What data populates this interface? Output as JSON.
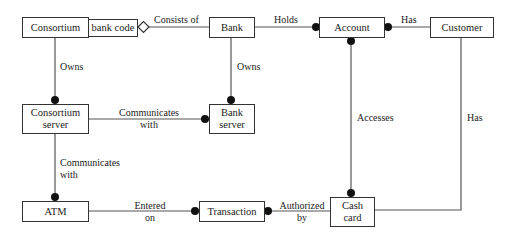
{
  "diagram": {
    "classes": {
      "consortium": "Consortium",
      "bank_code": "bank code",
      "bank": "Bank",
      "account": "Account",
      "customer": "Customer",
      "consortium_server_1": "Consortium",
      "consortium_server_2": "server",
      "bank_server_1": "Bank",
      "bank_server_2": "server",
      "atm": "ATM",
      "transaction": "Transaction",
      "cash_card_1": "Cash",
      "cash_card_2": "card"
    },
    "associations": {
      "consists_of": "Consists of",
      "holds": "Holds",
      "has_top": "Has",
      "owns_left": "Owns",
      "owns_right": "Owns",
      "communicates_mid_1": "Communicates",
      "communicates_mid_2": "with",
      "communicates_left_1": "Communicates",
      "communicates_left_2": "with",
      "accesses": "Accesses",
      "has_right": "Has",
      "entered_1": "Entered",
      "entered_2": "on",
      "authorized_1": "Authorized",
      "authorized_2": "by"
    },
    "colors": {
      "line": "#555555",
      "border": "#333333",
      "dot": "#111111"
    }
  }
}
